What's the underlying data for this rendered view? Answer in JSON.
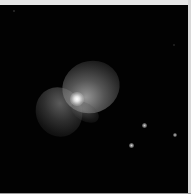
{
  "image": {
    "subject": "nebula",
    "description": "Bipolar nebula with bright central star against black sky",
    "background_color": "#020202",
    "border_color": "#e6e6e6"
  },
  "stars": [
    {
      "x": 144,
      "y": 120,
      "size": 5,
      "brightness": "#d0d0d0"
    },
    {
      "x": 175,
      "y": 130,
      "size": 4,
      "brightness": "#c0c0c0"
    },
    {
      "x": 131,
      "y": 140,
      "size": 5,
      "brightness": "#d8d8d8"
    },
    {
      "x": 14,
      "y": 6,
      "size": 2,
      "brightness": "#555555"
    },
    {
      "x": 174,
      "y": 40,
      "size": 2,
      "brightness": "#444444"
    }
  ]
}
